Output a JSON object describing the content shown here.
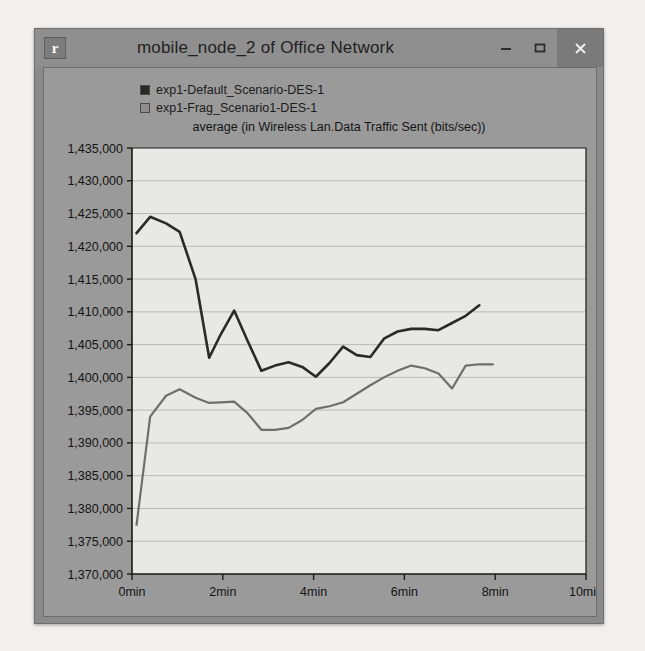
{
  "window": {
    "title": "mobile_node_2 of Office Network",
    "app_icon": "r",
    "minimize_label": "–",
    "maximize_label": "□",
    "close_label": "×",
    "colors": {
      "titlebar": "#8f8f8f",
      "frame": "#8a8a8a",
      "client": "#9a9a9a",
      "plot_background": "#e8e8e6",
      "close_button": "#7a7a7a"
    }
  },
  "legend": {
    "items": [
      {
        "label": "exp1-Default_Scenario-DES-1",
        "color": "#2a2a2a"
      },
      {
        "label": "exp1-Frag_Scenario1-DES-1",
        "color": "#6e6e6e"
      }
    ]
  },
  "chart_data": {
    "type": "line",
    "title": "average (in Wireless Lan.Data Traffic Sent (bits/sec))",
    "xlabel": "",
    "ylabel": "",
    "grid": true,
    "legend_position": "top-left",
    "xlim": [
      0,
      10
    ],
    "ylim": [
      1370000,
      1435000
    ],
    "xtick_labels": [
      "0min",
      "2min",
      "4min",
      "6min",
      "8min",
      "10min"
    ],
    "xtick_values": [
      0,
      2,
      4,
      6,
      8,
      10
    ],
    "ytick_labels": [
      "1,435,000",
      "1,430,000",
      "1,425,000",
      "1,420,000",
      "1,415,000",
      "1,410,000",
      "1,405,000",
      "1,400,000",
      "1,395,000",
      "1,390,000",
      "1,385,000",
      "1,380,000",
      "1,375,000",
      "1,370,000"
    ],
    "ytick_values": [
      1435000,
      1430000,
      1425000,
      1420000,
      1415000,
      1410000,
      1405000,
      1400000,
      1395000,
      1390000,
      1385000,
      1380000,
      1375000,
      1370000
    ],
    "series": [
      {
        "name": "exp1-Default_Scenario-DES-1",
        "color": "#2a2a2a",
        "x": [
          0.1,
          0.4,
          0.75,
          1.05,
          1.4,
          1.7,
          1.95,
          2.25,
          2.55,
          2.85,
          3.15,
          3.45,
          3.75,
          4.05,
          4.35,
          4.65,
          4.95,
          5.25,
          5.55,
          5.85,
          6.15,
          6.45,
          6.75,
          7.05,
          7.35,
          7.65
        ],
        "y": [
          1422000,
          1424500,
          1423500,
          1422200,
          1415000,
          1403000,
          1406500,
          1410200,
          1405500,
          1401000,
          1401800,
          1402300,
          1401600,
          1400100,
          1402200,
          1404700,
          1403400,
          1403100,
          1405900,
          1407000,
          1407400,
          1407400,
          1407200,
          1408300,
          1409400,
          1411000
        ]
      },
      {
        "name": "exp1-Frag_Scenario1-DES-1",
        "color": "#6e6e6e",
        "x": [
          0.1,
          0.4,
          0.75,
          1.05,
          1.4,
          1.7,
          1.95,
          2.25,
          2.55,
          2.85,
          3.15,
          3.45,
          3.75,
          4.05,
          4.35,
          4.65,
          4.95,
          5.25,
          5.55,
          5.85,
          6.15,
          6.45,
          6.75,
          7.05,
          7.35,
          7.65,
          7.95
        ],
        "y": [
          1377500,
          1394000,
          1397200,
          1398200,
          1396900,
          1396100,
          1396200,
          1396300,
          1394500,
          1392000,
          1392000,
          1392300,
          1393500,
          1395200,
          1395600,
          1396200,
          1397500,
          1398800,
          1400000,
          1401000,
          1401800,
          1401400,
          1400600,
          1398300,
          1401800,
          1402000,
          1402000
        ]
      }
    ]
  }
}
